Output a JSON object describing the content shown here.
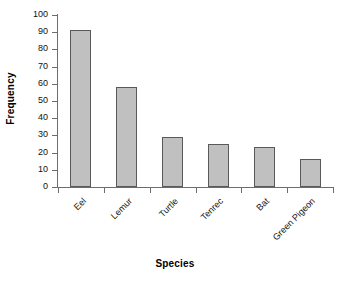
{
  "chart_data": {
    "type": "bar",
    "title": "",
    "xlabel": "Species",
    "ylabel": "Frequency",
    "categories": [
      "Eel",
      "Lemur",
      "Turtle",
      "Tenrec",
      "Bat",
      "Green Pigeon"
    ],
    "values": [
      91,
      58,
      29,
      25,
      23,
      16
    ],
    "ylim": [
      0,
      100
    ],
    "ytick_labels": [
      "100",
      "90",
      "80",
      "70",
      "60",
      "50",
      "40",
      "30",
      "20",
      "10",
      "0"
    ],
    "ytick_values": [
      100,
      90,
      80,
      70,
      60,
      50,
      40,
      30,
      20,
      10,
      0
    ],
    "ytick_step": 10,
    "grid": false,
    "legend": false,
    "bar_fill_color": "#c0c0c0",
    "bar_border_color": "#595959",
    "axis_color": "#6d6d6d",
    "background_color": "#ffffff",
    "xtick_label_rotation": -45
  }
}
